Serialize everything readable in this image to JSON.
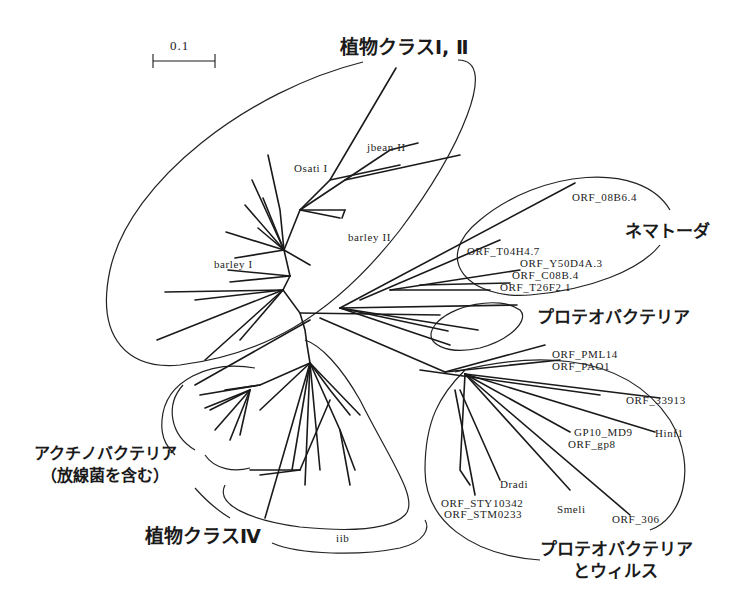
{
  "figure": {
    "type": "unrooted phylogenetic tree",
    "scale_bar": {
      "label": "0.1"
    }
  },
  "groups": {
    "plant_class_1_2": "植物クラスⅠ, Ⅱ",
    "nematoda": "ネマトーダ",
    "proteobacteria": "プロテオバクテリア",
    "proteobacteria_virus_line1": "プロテオバクテリア",
    "proteobacteria_virus_line2": "とウィルス",
    "actinobacteria_line1": "アクチノバクテリア",
    "actinobacteria_line2": "（放線菌を含む）",
    "plant_class_4": "植物クラスⅣ"
  },
  "leaves": {
    "osati1": "Osati I",
    "jbean2": "jbean II",
    "barley2": "barley II",
    "barley1": "barley I",
    "orf_08b6_4": "ORF_08B6.4",
    "orf_t04h4_7": "ORF_T04H4.7",
    "orf_y50d4a_3": "ORF_Y50D4A.3",
    "orf_c08b_4": "ORF_C08B.4",
    "orf_t26f2_1": "ORF_T26F2.1",
    "orf_pml14": "ORF_PML14",
    "orf_pao1": "ORF_PAO1",
    "orf_33913": "ORF_33913",
    "gp10_md9": "GP10_MD9",
    "hinf1": "Hinf1",
    "orf_gp8": "ORF_gp8",
    "dradi": "Dradi",
    "orf_sty10342": "ORF_STY10342",
    "orf_stm0233": "ORF_STM0233",
    "smeli": "Smeli",
    "orf_306": "ORF_306",
    "iib": "iib"
  },
  "colors": {
    "ink": "#1a1a1a",
    "background": "#ffffff"
  }
}
